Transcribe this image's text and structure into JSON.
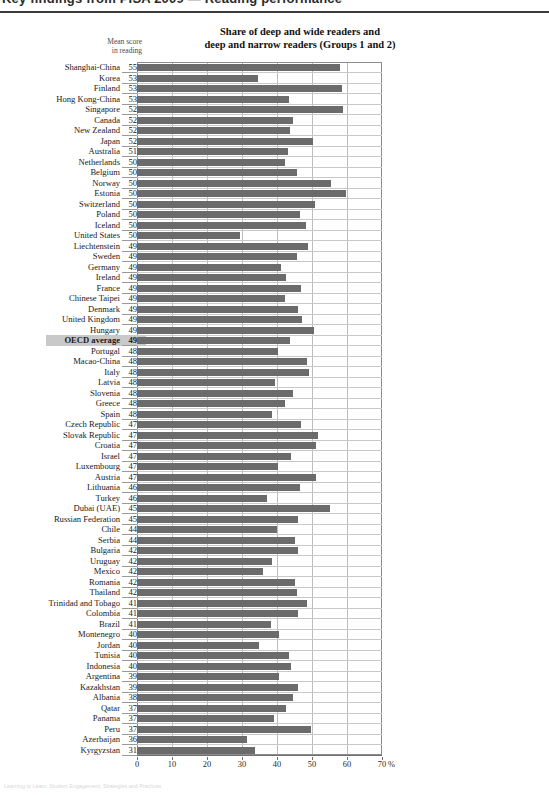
{
  "page_header": {
    "text": "Key findings from PISA 2009 — Reading performance"
  },
  "footer": {
    "text": "Learning to Learn: Student Engagement, Strategies and Practices"
  },
  "chart_data": {
    "type": "bar",
    "orientation": "horizontal",
    "title": "Share of deep and wide readers and deep and narrow readers (Groups 1 and 2)",
    "title_line1": "Share of deep and wide readers and",
    "title_line2": "deep and narrow readers (Groups 1 and 2)",
    "score_column_header_line1": "Mean score",
    "score_column_header_line2": "in reading",
    "xlabel": "",
    "ylabel": "",
    "unit": "%",
    "xlim": [
      0,
      70
    ],
    "xticks": [
      0,
      10,
      20,
      30,
      40,
      50,
      60,
      70
    ],
    "xtick_labels": [
      "0",
      "10",
      "20",
      "30",
      "40",
      "50",
      "60",
      "70"
    ],
    "grid": true,
    "legend": null,
    "bar_color": "#6b6b6b",
    "highlight_color": "#c9c9c9",
    "highlight_category": "OECD average",
    "categories": [
      "Shanghai-China",
      "Korea",
      "Finland",
      "Hong Kong-China",
      "Singapore",
      "Canada",
      "New Zealand",
      "Japan",
      "Australia",
      "Netherlands",
      "Belgium",
      "Norway",
      "Estonia",
      "Switzerland",
      "Poland",
      "Iceland",
      "United States",
      "Liechtenstein",
      "Sweden",
      "Germany",
      "Ireland",
      "France",
      "Chinese Taipei",
      "Denmark",
      "United Kingdom",
      "Hungary",
      "OECD average",
      "Portugal",
      "Macao-China",
      "Italy",
      "Latvia",
      "Slovenia",
      "Greece",
      "Spain",
      "Czech Republic",
      "Slovak Republic",
      "Croatia",
      "Israel",
      "Luxembourg",
      "Austria",
      "Lithuania",
      "Turkey",
      "Dubai (UAE)",
      "Russian Federation",
      "Chile",
      "Serbia",
      "Bulgaria",
      "Uruguay",
      "Mexico",
      "Romania",
      "Thailand",
      "Trinidad and Tobago",
      "Colombia",
      "Brazil",
      "Montenegro",
      "Jordan",
      "Tunisia",
      "Indonesia",
      "Argentina",
      "Kazakhstan",
      "Albania",
      "Qatar",
      "Panama",
      "Peru",
      "Azerbaijan",
      "Kyrgyzstan"
    ],
    "mean_scores": [
      556,
      539,
      536,
      533,
      526,
      524,
      521,
      520,
      515,
      508,
      506,
      503,
      501,
      501,
      500,
      500,
      500,
      499,
      497,
      497,
      496,
      496,
      495,
      495,
      494,
      494,
      493,
      489,
      487,
      486,
      484,
      483,
      483,
      481,
      478,
      477,
      476,
      474,
      472,
      470,
      468,
      464,
      459,
      459,
      449,
      442,
      429,
      426,
      425,
      424,
      421,
      416,
      413,
      412,
      408,
      405,
      404,
      402,
      398,
      390,
      385,
      372,
      371,
      370,
      362,
      314
    ],
    "values": [
      58.0,
      34.6,
      58.6,
      43.4,
      58.8,
      44.6,
      43.8,
      50.4,
      43.0,
      42.4,
      45.6,
      55.4,
      59.6,
      50.8,
      46.6,
      48.4,
      29.4,
      48.9,
      45.6,
      41.0,
      42.6,
      46.8,
      42.2,
      46.0,
      47.0,
      50.6,
      43.8,
      40.4,
      48.6,
      49.2,
      39.4,
      44.6,
      42.2,
      38.6,
      46.8,
      51.6,
      51.0,
      44.0,
      40.4,
      51.0,
      46.6,
      37.0,
      55.0,
      46.0,
      40.0,
      45.2,
      46.0,
      38.6,
      36.0,
      45.0,
      45.6,
      48.6,
      46.0,
      38.2,
      40.6,
      34.8,
      43.4,
      44.0,
      40.6,
      46.0,
      44.6,
      42.6,
      39.0,
      49.6,
      31.4,
      33.6
    ]
  }
}
